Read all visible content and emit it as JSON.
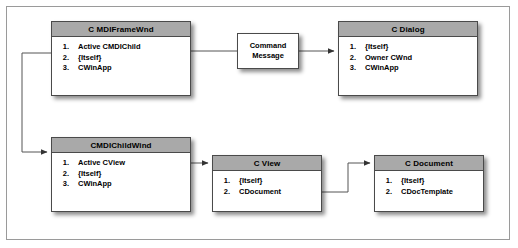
{
  "diagram": {
    "boxes": [
      {
        "id": "mdiframewnd",
        "title": "C MDIFrameWnd",
        "rows": [
          {
            "num": "1.",
            "label": "Active CMDIChild"
          },
          {
            "num": "2.",
            "label": "{Itself}"
          },
          {
            "num": "3.",
            "label": "CWinApp"
          }
        ]
      },
      {
        "id": "cdialog",
        "title": "C Dialog",
        "rows": [
          {
            "num": "1.",
            "label": "{Itself}"
          },
          {
            "num": "2.",
            "label": "Owner CWnd"
          },
          {
            "num": "3.",
            "label": "CWinApp"
          }
        ]
      },
      {
        "id": "cmdichildwind",
        "title": "CMDIChildWind",
        "rows": [
          {
            "num": "1.",
            "label": "Active CView"
          },
          {
            "num": "2.",
            "label": "{Itself}"
          },
          {
            "num": "3.",
            "label": "CWinApp"
          }
        ]
      },
      {
        "id": "cview",
        "title": "C View",
        "rows": [
          {
            "num": "1.",
            "label": "{Itself}"
          },
          {
            "num": "2.",
            "label": "CDocument"
          }
        ]
      },
      {
        "id": "cdocument",
        "title": "C Document",
        "rows": [
          {
            "num": "1.",
            "label": "{Itself}"
          },
          {
            "num": "2.",
            "label": "CDocTemplate"
          }
        ]
      }
    ],
    "command_box": {
      "line1": "Command",
      "line2": "Message"
    },
    "colors": {
      "header_fill": "#a9a9a9",
      "box_fill": "#ffffff",
      "box_border": "#4a4a4a",
      "connector": "#555555",
      "frame_border": "#9a9a9a",
      "background": "#ffffff"
    }
  }
}
